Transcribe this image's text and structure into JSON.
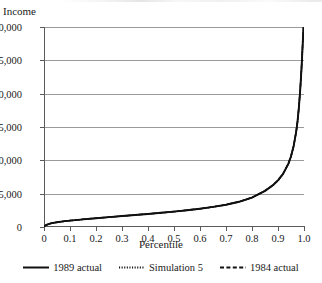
{
  "chart_data": {
    "type": "line",
    "title": "",
    "xlabel": "Percentile",
    "ylabel": "Income",
    "xlim": [
      0,
      1.0
    ],
    "ylim": [
      0,
      30000
    ],
    "grid": true,
    "legend_position": "bottom",
    "x_ticks": [
      "0",
      "0.1",
      "0.2",
      "0.3",
      "0.4",
      "0.5",
      "0.6",
      "0.7",
      "0.8",
      "0.9",
      "1.0"
    ],
    "x_tick_values": [
      0,
      0.1,
      0.2,
      0.3,
      0.4,
      0.5,
      0.6,
      0.7,
      0.8,
      0.9,
      1.0
    ],
    "y_ticks": [
      "0",
      "5,000",
      "10,000",
      "15,000",
      "20,000",
      "25,000",
      "30,000"
    ],
    "y_tick_values": [
      0,
      5000,
      10000,
      15000,
      20000,
      25000,
      30000
    ],
    "x": [
      0.0,
      0.01,
      0.02,
      0.03,
      0.05,
      0.08,
      0.1,
      0.15,
      0.2,
      0.25,
      0.3,
      0.35,
      0.4,
      0.45,
      0.5,
      0.55,
      0.6,
      0.65,
      0.7,
      0.75,
      0.8,
      0.85,
      0.88,
      0.9,
      0.92,
      0.94,
      0.95,
      0.96,
      0.97,
      0.975,
      0.98,
      0.985,
      0.99,
      0.993,
      0.995,
      0.997,
      0.998,
      0.999,
      1.0
    ],
    "series": [
      {
        "name": "1989 actual",
        "style": "solid",
        "color": "#111111",
        "values": [
          120,
          320,
          470,
          580,
          720,
          880,
          960,
          1150,
          1320,
          1480,
          1640,
          1800,
          1960,
          2130,
          2310,
          2510,
          2740,
          3010,
          3340,
          3780,
          4420,
          5420,
          6250,
          7000,
          8000,
          9500,
          10600,
          12100,
          14300,
          15800,
          17800,
          20300,
          23500,
          25800,
          27500,
          29000,
          29800,
          30000,
          30000
        ]
      },
      {
        "name": "Simulation 5",
        "style": "dotted",
        "color": "#111111",
        "values": [
          110,
          310,
          460,
          570,
          710,
          870,
          950,
          1140,
          1310,
          1470,
          1630,
          1790,
          1950,
          2120,
          2300,
          2500,
          2730,
          3000,
          3330,
          3770,
          4400,
          5400,
          6220,
          6970,
          7960,
          9450,
          10550,
          12050,
          14250,
          15750,
          17750,
          20250,
          23450,
          25750,
          27450,
          28950,
          29780,
          30000,
          30000
        ]
      },
      {
        "name": "1984 actual",
        "style": "dashed",
        "color": "#111111",
        "values": [
          130,
          330,
          480,
          590,
          730,
          890,
          970,
          1160,
          1330,
          1490,
          1650,
          1810,
          1975,
          2145,
          2325,
          2525,
          2755,
          3025,
          3355,
          3795,
          4440,
          5440,
          6280,
          7030,
          8040,
          9550,
          10650,
          12150,
          14350,
          15850,
          17850,
          20350,
          23550,
          25850,
          27550,
          29050,
          29820,
          30000,
          30000
        ]
      }
    ]
  },
  "axes": {
    "ylabel": "Income",
    "xlabel": "Percentile"
  },
  "legend": {
    "items": [
      {
        "label": "1989 actual",
        "style": "solid"
      },
      {
        "label": "Simulation 5",
        "style": "dotted"
      },
      {
        "label": "1984 actual",
        "style": "dashed"
      }
    ]
  }
}
